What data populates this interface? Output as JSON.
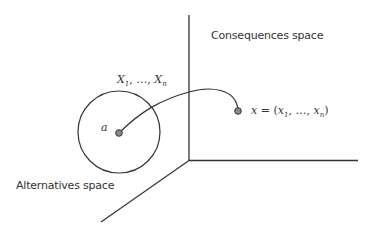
{
  "diagram": {
    "labels": {
      "consequences_space": "Consequences space",
      "alternatives_space": "Alternatives space",
      "alternative_point": "a",
      "attributes": {
        "var": "X",
        "first_sub": "1",
        "sep": ", …, ",
        "last_sub": "n"
      },
      "consequence_point": {
        "lhs": "x",
        "eq": " = (",
        "var": "x",
        "first_sub": "1",
        "sep": ", …, ",
        "last_sub": "n",
        "close": ")"
      }
    },
    "colors": {
      "line": "#333333",
      "dot_fill": "#8a8a8a",
      "background": "#ffffff"
    }
  }
}
